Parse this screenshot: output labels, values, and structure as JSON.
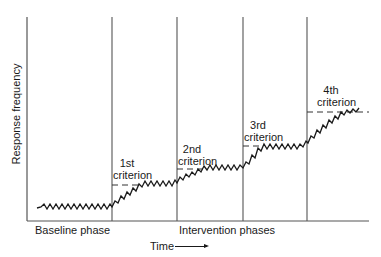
{
  "diagram": {
    "type": "changing-criterion design graph",
    "y_axis_label": "Response frequency",
    "x_axis_label": "Time",
    "phase_labels": {
      "baseline": "Baseline phase",
      "intervention": "Intervention phases"
    },
    "criteria": [
      {
        "line1": "1st",
        "line2": "criterion"
      },
      {
        "line1": "2nd",
        "line2": "criterion"
      },
      {
        "line1": "3rd",
        "line2": "criterion"
      },
      {
        "line1": "4th",
        "line2": "criterion"
      }
    ],
    "colors": {
      "line": "#1a1a1a",
      "axis": "#555555",
      "background": "#ffffff"
    }
  }
}
